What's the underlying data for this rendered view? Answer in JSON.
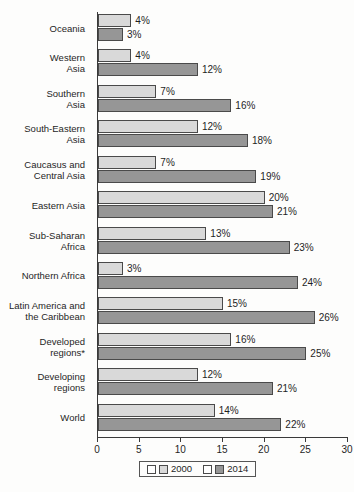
{
  "chart_data": {
    "type": "bar",
    "orientation": "horizontal",
    "title": "",
    "subtitle": "",
    "xlabel": "",
    "ylabel": "",
    "xlim": [
      0,
      30
    ],
    "xticks": [
      0,
      5,
      10,
      15,
      20,
      25,
      30
    ],
    "xtick_labels": [
      "0",
      "5",
      "10",
      "15",
      "20",
      "25",
      "30"
    ],
    "grid": false,
    "legend_position": "bottom",
    "value_suffix": "%",
    "categories": [
      "Oceania",
      "Western Asia",
      "Southern Asia",
      "South-Eastern Asia",
      "Caucasus and Central Asia",
      "Eastern Asia",
      "Sub-Saharan Africa",
      "Northern Africa",
      "Latin America and the Caribbean",
      "Developed regions*",
      "Developing regions",
      "World"
    ],
    "category_lines": [
      [
        "Oceania"
      ],
      [
        "Western",
        "Asia"
      ],
      [
        "Southern",
        "Asia"
      ],
      [
        "South-Eastern",
        "Asia"
      ],
      [
        "Caucasus and",
        "Central Asia"
      ],
      [
        "Eastern Asia"
      ],
      [
        "Sub-Saharan",
        "Africa"
      ],
      [
        "Northern Africa"
      ],
      [
        "Latin America and",
        "the Caribbean"
      ],
      [
        "Developed",
        "regions*"
      ],
      [
        "Developing",
        "regions"
      ],
      [
        "World"
      ]
    ],
    "series": [
      {
        "name": "2000",
        "color": "#d9d9d9",
        "values": [
          4,
          4,
          7,
          12,
          7,
          20,
          13,
          3,
          15,
          16,
          12,
          14
        ],
        "labels": [
          "4%",
          "4%",
          "7%",
          "12%",
          "7%",
          "20%",
          "13%",
          "3%",
          "15%",
          "16%",
          "12%",
          "14%"
        ]
      },
      {
        "name": "2014",
        "color": "#969696",
        "values": [
          3,
          12,
          16,
          18,
          19,
          21,
          23,
          24,
          26,
          25,
          21,
          22
        ],
        "labels": [
          "3%",
          "12%",
          "16%",
          "18%",
          "19%",
          "21%",
          "23%",
          "24%",
          "26%",
          "25%",
          "21%",
          "22%"
        ]
      }
    ]
  },
  "legend": {
    "entries": [
      {
        "label": "2000"
      },
      {
        "label": "2014"
      }
    ]
  }
}
